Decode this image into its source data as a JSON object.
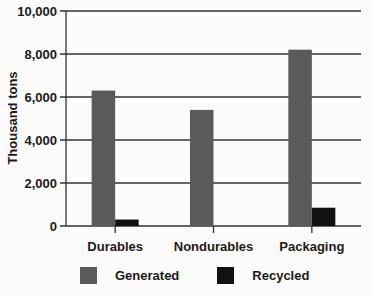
{
  "chart_data": {
    "type": "bar",
    "title": "",
    "xlabel": "",
    "ylabel": "Thousand tons",
    "ylim": [
      0,
      10000
    ],
    "yticks": [
      0,
      2000,
      4000,
      6000,
      8000,
      10000
    ],
    "ytick_labels": [
      "0",
      "2,000",
      "4,000",
      "6,000",
      "8,000",
      "10,000"
    ],
    "grid": true,
    "legend_position": "bottom",
    "categories": [
      "Durables",
      "Nondurables",
      "Packaging"
    ],
    "series": [
      {
        "name": "Generated",
        "color": "#5a5a5a",
        "values": [
          6300,
          5400,
          8200
        ]
      },
      {
        "name": "Recycled",
        "color": "#111111",
        "values": [
          300,
          0,
          850
        ]
      }
    ]
  },
  "legend": {
    "items": [
      {
        "label": "Generated",
        "color": "#5a5a5a"
      },
      {
        "label": "Recycled",
        "color": "#111111"
      }
    ]
  }
}
